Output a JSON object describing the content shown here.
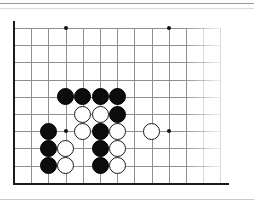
{
  "figure": {
    "kind": "go-board-diagram",
    "board_size": 19,
    "visible_region": "upper-left corner",
    "visible_columns": 13,
    "visible_rows": 10
  },
  "board": {
    "origin": {
      "x": 14,
      "y": 28
    },
    "spacing": 17.2,
    "line_color": "#8f8f93",
    "edge_color": "#1a1a1a",
    "background_color": "#ffffff",
    "columns": 13,
    "rows": 10,
    "edges": [
      "left",
      "bottom"
    ],
    "grid_fade_right": true
  },
  "star_points": [
    {
      "name": "hoshi-upper-left",
      "col": 3,
      "row": 0,
      "x": 66,
      "y": 28
    },
    {
      "name": "hoshi-upper-middle",
      "col": 9,
      "row": 0,
      "x": 169,
      "y": 28
    },
    {
      "name": "hoshi-left-side",
      "col": 3,
      "row": 6,
      "x": 66,
      "y": 131
    },
    {
      "name": "hoshi-middle",
      "col": 9,
      "row": 6,
      "x": 169,
      "y": 131
    }
  ],
  "stones": [
    {
      "id": 1,
      "color": "black",
      "col": 3,
      "row": 4,
      "x": 66,
      "y": 97
    },
    {
      "id": 2,
      "color": "black",
      "col": 4,
      "row": 4,
      "x": 83,
      "y": 97
    },
    {
      "id": 3,
      "color": "black",
      "col": 5,
      "row": 4,
      "x": 100,
      "y": 97
    },
    {
      "id": 4,
      "color": "black",
      "col": 6,
      "row": 4,
      "x": 118,
      "y": 97
    },
    {
      "id": 5,
      "color": "white",
      "col": 4,
      "row": 5,
      "x": 83,
      "y": 114
    },
    {
      "id": 6,
      "color": "white",
      "col": 5,
      "row": 5,
      "x": 100,
      "y": 114
    },
    {
      "id": 7,
      "color": "black",
      "col": 6,
      "row": 5,
      "x": 118,
      "y": 114
    },
    {
      "id": 8,
      "color": "black",
      "col": 2,
      "row": 6,
      "x": 49,
      "y": 131
    },
    {
      "id": 9,
      "color": "white",
      "col": 4,
      "row": 6,
      "x": 83,
      "y": 131
    },
    {
      "id": 10,
      "color": "black",
      "col": 5,
      "row": 6,
      "x": 100,
      "y": 131
    },
    {
      "id": 11,
      "color": "white",
      "col": 6,
      "row": 6,
      "x": 118,
      "y": 131
    },
    {
      "id": 12,
      "color": "white",
      "col": 8,
      "row": 6,
      "x": 152,
      "y": 131
    },
    {
      "id": 13,
      "color": "black",
      "col": 2,
      "row": 7,
      "x": 49,
      "y": 148
    },
    {
      "id": 14,
      "color": "white",
      "col": 3,
      "row": 7,
      "x": 66,
      "y": 148
    },
    {
      "id": 15,
      "color": "black",
      "col": 5,
      "row": 7,
      "x": 100,
      "y": 148
    },
    {
      "id": 16,
      "color": "white",
      "col": 6,
      "row": 7,
      "x": 118,
      "y": 148
    },
    {
      "id": 17,
      "color": "black",
      "col": 2,
      "row": 8,
      "x": 49,
      "y": 165
    },
    {
      "id": 18,
      "color": "white",
      "col": 3,
      "row": 8,
      "x": 66,
      "y": 165
    },
    {
      "id": 19,
      "color": "black",
      "col": 5,
      "row": 8,
      "x": 100,
      "y": 165
    },
    {
      "id": 20,
      "color": "white",
      "col": 6,
      "row": 8,
      "x": 118,
      "y": 165
    }
  ],
  "colors": {
    "black_stone": "#0d0d0d",
    "white_stone": "#ffffff",
    "stone_outline": "#1a1a1a",
    "grid": "#8f8f93",
    "page_background": "#ffffff"
  }
}
